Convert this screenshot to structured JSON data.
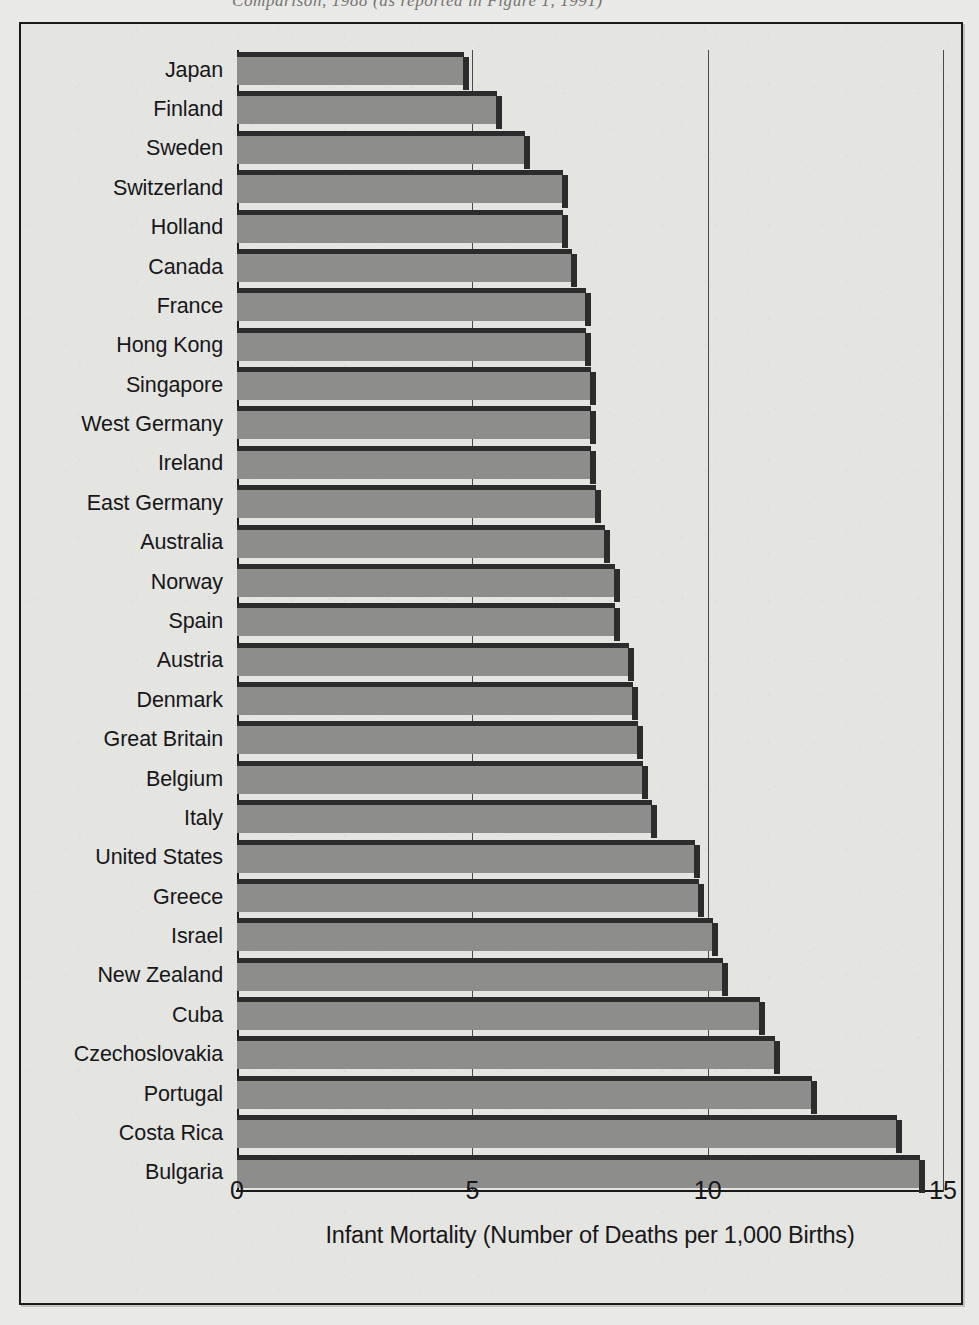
{
  "page": {
    "top_caption_fragment": "Comparison, 1988 (as reported in Figure 1, 1991)"
  },
  "chart_data": {
    "type": "bar",
    "orientation": "horizontal",
    "title": "",
    "xlabel": "Infant Mortality (Number of Deaths per 1,000 Births)",
    "ylabel": "",
    "xlim": [
      0,
      15
    ],
    "xticks": [
      "0",
      "5",
      "10",
      "15"
    ],
    "xtick_values": [
      0,
      5,
      10,
      15
    ],
    "grid": true,
    "grid_axis": "x",
    "legend": "none",
    "bar_fill_color": "#8d8d8c",
    "bar_edge_color": "#2c2c2c",
    "plot_background_color": "#e4e4e1",
    "frame_color": "#1a1a1a",
    "categories": [
      "Japan",
      "Finland",
      "Sweden",
      "Switzerland",
      "Holland",
      "Canada",
      "France",
      "Hong Kong",
      "Singapore",
      "West Germany",
      "Ireland",
      "East Germany",
      "Australia",
      "Norway",
      "Spain",
      "Austria",
      "Denmark",
      "Great Britain",
      "Belgium",
      "Italy",
      "United States",
      "Greece",
      "Israel",
      "New Zealand",
      "Cuba",
      "Czechoslovakia",
      "Portugal",
      "Costa Rica",
      "Bulgaria"
    ],
    "values": [
      4.8,
      5.5,
      6.1,
      6.9,
      6.9,
      7.1,
      7.4,
      7.4,
      7.5,
      7.5,
      7.5,
      7.6,
      7.8,
      8.0,
      8.0,
      8.3,
      8.4,
      8.5,
      8.6,
      8.8,
      9.7,
      9.8,
      10.1,
      10.3,
      11.1,
      11.4,
      12.2,
      14.0,
      14.5
    ]
  }
}
